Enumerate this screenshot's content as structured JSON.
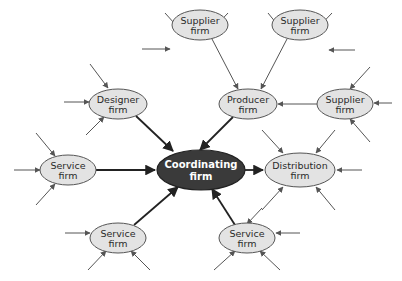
{
  "diagram": {
    "type": "hub-and-spoke network",
    "colors": {
      "center_fill": "#3a3a3a",
      "center_text": "#ffffff",
      "node_fill": "#e3e3e3",
      "node_stroke": "#555555",
      "main_arrow": "#222222",
      "minor_arrow": "#555555"
    },
    "center": {
      "id": "coordinating",
      "line1": "Coordinating",
      "line2": "firm",
      "cx": 201,
      "cy": 170,
      "rx": 44,
      "ry": 20
    },
    "nodes": [
      {
        "id": "supplier1",
        "line1": "Supplier",
        "line2": "firm",
        "cx": 200,
        "cy": 25,
        "rx": 28,
        "ry": 15
      },
      {
        "id": "supplier2",
        "line1": "Supplier",
        "line2": "firm",
        "cx": 300,
        "cy": 25,
        "rx": 28,
        "ry": 15
      },
      {
        "id": "designer",
        "line1": "Designer",
        "line2": "firm",
        "cx": 118,
        "cy": 104,
        "rx": 29,
        "ry": 15
      },
      {
        "id": "producer",
        "line1": "Producer",
        "line2": "firm",
        "cx": 248,
        "cy": 104,
        "rx": 29,
        "ry": 15
      },
      {
        "id": "supplier3",
        "line1": "Supplier",
        "line2": "firm",
        "cx": 345,
        "cy": 104,
        "rx": 28,
        "ry": 15
      },
      {
        "id": "service_left",
        "line1": "Service",
        "line2": "firm",
        "cx": 68,
        "cy": 170,
        "rx": 28,
        "ry": 15
      },
      {
        "id": "distribution",
        "line1": "Distribution",
        "line2": "firm",
        "cx": 300,
        "cy": 170,
        "rx": 35,
        "ry": 17
      },
      {
        "id": "service_bottom_left",
        "line1": "Service",
        "line2": "firm",
        "cx": 118,
        "cy": 238,
        "rx": 28,
        "ry": 15
      },
      {
        "id": "service_bottom_right",
        "line1": "Service",
        "line2": "firm",
        "cx": 247,
        "cy": 238,
        "rx": 28,
        "ry": 15
      }
    ],
    "main_links": [
      {
        "from": "designer",
        "to": "coordinating",
        "x1": 136,
        "y1": 116,
        "x2": 173,
        "y2": 151
      },
      {
        "from": "producer",
        "to": "coordinating",
        "x1": 233,
        "y1": 117,
        "x2": 200,
        "y2": 150
      },
      {
        "from": "service_left",
        "to": "coordinating",
        "x1": 96,
        "y1": 170,
        "x2": 155,
        "y2": 170
      },
      {
        "from": "coordinating",
        "to": "distribution",
        "x1": 245,
        "y1": 170,
        "x2": 263,
        "y2": 170
      },
      {
        "from": "service_bottom_left",
        "to": "coordinating",
        "x1": 134,
        "y1": 225,
        "x2": 178,
        "y2": 187
      },
      {
        "from": "service_bottom_right",
        "to": "coordinating",
        "x1": 235,
        "y1": 225,
        "x2": 212,
        "y2": 189
      }
    ],
    "secondary_links": [
      {
        "from": "supplier1",
        "to": "producer",
        "x1": 212,
        "y1": 39,
        "x2": 238,
        "y2": 89
      },
      {
        "from": "supplier2",
        "to": "producer",
        "x1": 287,
        "y1": 39,
        "x2": 261,
        "y2": 89
      },
      {
        "from": "supplier3",
        "to": "producer",
        "x1": 317,
        "y1": 104,
        "x2": 278,
        "y2": 104
      }
    ],
    "incoming_stubs": [
      {
        "x1": 165,
        "y1": 13,
        "x2": 184,
        "y2": 34
      },
      {
        "x1": 228,
        "y1": 13,
        "x2": 210,
        "y2": 32
      },
      {
        "x1": 142,
        "y1": 49,
        "x2": 170,
        "y2": 49
      },
      {
        "x1": 268,
        "y1": 13,
        "x2": 285,
        "y2": 34
      },
      {
        "x1": 332,
        "y1": 13,
        "x2": 313,
        "y2": 33
      },
      {
        "x1": 355,
        "y1": 50,
        "x2": 329,
        "y2": 50
      },
      {
        "x1": 90,
        "y1": 64,
        "x2": 108,
        "y2": 88
      },
      {
        "x1": 64,
        "y1": 102,
        "x2": 89,
        "y2": 102
      },
      {
        "x1": 86,
        "y1": 135,
        "x2": 104,
        "y2": 117
      },
      {
        "x1": 370,
        "y1": 67,
        "x2": 350,
        "y2": 89
      },
      {
        "x1": 392,
        "y1": 103,
        "x2": 374,
        "y2": 103
      },
      {
        "x1": 370,
        "y1": 142,
        "x2": 350,
        "y2": 119
      },
      {
        "x1": 36,
        "y1": 133,
        "x2": 55,
        "y2": 156
      },
      {
        "x1": 14,
        "y1": 170,
        "x2": 40,
        "y2": 170
      },
      {
        "x1": 36,
        "y1": 205,
        "x2": 55,
        "y2": 184
      },
      {
        "x1": 262,
        "y1": 130,
        "x2": 283,
        "y2": 153
      },
      {
        "x1": 335,
        "y1": 130,
        "x2": 316,
        "y2": 153
      },
      {
        "x1": 362,
        "y1": 170,
        "x2": 337,
        "y2": 170
      },
      {
        "x1": 262,
        "y1": 210,
        "x2": 283,
        "y2": 187
      },
      {
        "x1": 335,
        "y1": 210,
        "x2": 316,
        "y2": 187
      },
      {
        "x1": 65,
        "y1": 233,
        "x2": 90,
        "y2": 233
      },
      {
        "x1": 88,
        "y1": 270,
        "x2": 106,
        "y2": 251
      },
      {
        "x1": 150,
        "y1": 270,
        "x2": 131,
        "y2": 251
      },
      {
        "x1": 300,
        "y1": 233,
        "x2": 276,
        "y2": 233
      },
      {
        "x1": 214,
        "y1": 270,
        "x2": 235,
        "y2": 251
      },
      {
        "x1": 280,
        "y1": 270,
        "x2": 260,
        "y2": 251
      },
      {
        "x1": 262,
        "y1": 208,
        "x2": 247,
        "y2": 224
      }
    ]
  }
}
